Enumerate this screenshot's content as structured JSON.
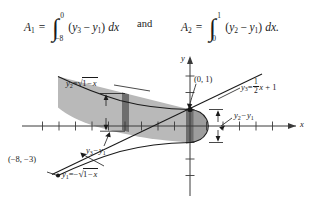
{
  "figure": {
    "type": "calculus-area-between-curves-diagram",
    "formulas": {
      "area1": {
        "name": "A1",
        "symbol": "A",
        "subscript": "1",
        "equals": "=",
        "lower_limit": "−8",
        "upper_limit": "0",
        "integrand_left": "y",
        "integrand_left_sub": "3",
        "operator": "−",
        "integrand_right": "y",
        "integrand_right_sub": "1",
        "differential": "dx",
        "text": "A₁ = ∫ from −8 to 0 of (y₃ − y₁) dx"
      },
      "conjunction": "and",
      "area2": {
        "name": "A2",
        "symbol": "A",
        "subscript": "2",
        "equals": "=",
        "lower_limit": "0",
        "upper_limit": "1",
        "integrand_left": "y",
        "integrand_left_sub": "2",
        "operator": "−",
        "integrand_right": "y",
        "integrand_right_sub": "1",
        "differential": "dx.",
        "text": "A₂ = ∫ from 0 to 1 of (y₂ − y₁) dx."
      }
    },
    "axes": {
      "x_axis_label": "x",
      "y_axis_label": "y",
      "x_ticks": 13,
      "y_ticks": 5
    },
    "labels": {
      "curve_y2": {
        "lhs": "y",
        "lhs_sub": "2",
        "eq": "=",
        "radicand": "1 − x",
        "text": "y₂ = √(1−x)"
      },
      "curve_y1": {
        "lhs": "y",
        "lhs_sub": "1",
        "eq": "=",
        "neg": "−",
        "radicand": "1 − x",
        "text": "y₁ = −√(1−x)"
      },
      "curve_y3": {
        "lhs": "y",
        "lhs_sub": "3",
        "eq": "=",
        "frac_num": "1",
        "frac_den": "2",
        "var": "x",
        "plus": "+ 1",
        "text": "y₃ = ½x + 1"
      },
      "point_origin_top": "(0, 1)",
      "point_lower_left": "(−8, −3)",
      "strip_right": {
        "a": "y",
        "a_sub": "2",
        "minus": "−",
        "b": "y",
        "b_sub": "1",
        "text": "y₂ − y₁"
      },
      "strip_left": {
        "a": "y",
        "a_sub": "3",
        "minus": "−",
        "b": "y",
        "b_sub": "1",
        "text": "y₃ − y₁"
      }
    },
    "colors": {
      "ink": "#1a1a1a",
      "region_light": "#b9b9b9",
      "region_mid": "#9d9d9d",
      "strip_dark": "#6e6e6e",
      "axis": "#3a3a3a"
    }
  }
}
